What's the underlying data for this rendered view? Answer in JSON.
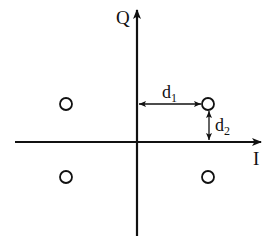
{
  "diagram": {
    "type": "constellation-diagram",
    "axes": {
      "horizontal": {
        "label": "I"
      },
      "vertical": {
        "label": "Q"
      }
    },
    "points": [
      {
        "id": "top-left",
        "cx": 66,
        "cy": 104
      },
      {
        "id": "top-right",
        "cx": 208,
        "cy": 104
      },
      {
        "id": "bottom-left",
        "cx": 66,
        "cy": 177
      },
      {
        "id": "bottom-right",
        "cx": 208,
        "cy": 177
      }
    ],
    "dimensions": {
      "d1": {
        "base": "d",
        "sub": "1"
      },
      "d2": {
        "base": "d",
        "sub": "2"
      }
    },
    "colors": {
      "stroke": "#111111",
      "background": "#ffffff"
    }
  }
}
